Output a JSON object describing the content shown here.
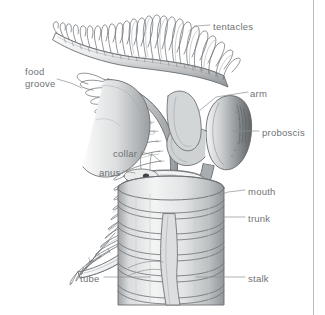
{
  "figure": {
    "kind": "anatomical-line-drawing",
    "background_color": "#ffffff",
    "ink_color": "#5a5e62",
    "label_color": "#6f7275",
    "leader_color": "#8d9094",
    "border_color": "#b9bcbe"
  },
  "labels": [
    {
      "id": "tentacles",
      "text": "tentacles",
      "x": 213,
      "y": 21,
      "align": "left"
    },
    {
      "id": "food_groove_line1",
      "text": "food",
      "x": 25,
      "y": 66,
      "align": "left"
    },
    {
      "id": "food_groove_line2",
      "text": "groove",
      "x": 25,
      "y": 78,
      "align": "left"
    },
    {
      "id": "arm",
      "text": "arm",
      "x": 250,
      "y": 88,
      "align": "left"
    },
    {
      "id": "proboscis",
      "text": "proboscis",
      "x": 262,
      "y": 127,
      "align": "left"
    },
    {
      "id": "collar",
      "text": "collar",
      "x": 113,
      "y": 148,
      "align": "left"
    },
    {
      "id": "anus",
      "text": "anus",
      "x": 99,
      "y": 167,
      "align": "left"
    },
    {
      "id": "mouth",
      "text": "mouth",
      "x": 248,
      "y": 186,
      "align": "left"
    },
    {
      "id": "trunk",
      "text": "trunk",
      "x": 248,
      "y": 213,
      "align": "left"
    },
    {
      "id": "tube",
      "text": "tube",
      "x": 80,
      "y": 273,
      "align": "left"
    },
    {
      "id": "stalk",
      "text": "stalk",
      "x": 248,
      "y": 273,
      "align": "left"
    }
  ],
  "structures": [
    {
      "id": "upper-arm",
      "name": "upper arm with tentacles"
    },
    {
      "id": "lower-arm",
      "name": "lower arm with tentacles"
    },
    {
      "id": "proboscis-body",
      "name": "proboscis"
    },
    {
      "id": "collar-body",
      "name": "collar"
    },
    {
      "id": "trunk-body",
      "name": "trunk"
    },
    {
      "id": "tube-body",
      "name": "secreted tube with rings"
    },
    {
      "id": "stalk-body",
      "name": "stalk"
    },
    {
      "id": "mouth-opening",
      "name": "mouth"
    },
    {
      "id": "anus-opening",
      "name": "anus"
    }
  ]
}
